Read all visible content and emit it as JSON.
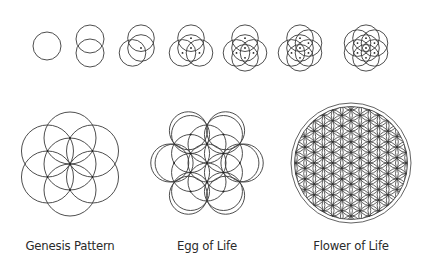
{
  "stroke_color": "#3a3a3a",
  "background": "#ffffff",
  "progression_row": {
    "steps": [
      {
        "circles": 1,
        "cx": 47,
        "cy": 47
      },
      {
        "circles": 2,
        "cx": 90,
        "cy": 47
      },
      {
        "circles": 3,
        "cx": 140,
        "cy": 47
      },
      {
        "circles": 4,
        "cx": 190,
        "cy": 47
      },
      {
        "circles": 5,
        "cx": 245,
        "cy": 47
      },
      {
        "circles": 6,
        "cx": 300,
        "cy": 47
      },
      {
        "circles": 7,
        "cx": 365,
        "cy": 47
      }
    ],
    "radius": 14
  },
  "figures": [
    {
      "name": "genesis",
      "label": "Genesis Pattern",
      "label_x": 70
    },
    {
      "name": "egg",
      "label": "Egg of Life",
      "label_x": 207
    },
    {
      "name": "flower",
      "label": "Flower of Life",
      "label_x": 351
    }
  ]
}
